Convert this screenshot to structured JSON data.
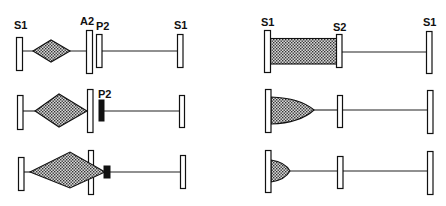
{
  "diagram": {
    "left_panel": {
      "rows": [
        {
          "labels": {
            "left": "S1",
            "middle_a": "A2",
            "middle_b": "P2",
            "right": "S1"
          },
          "state": "small diamond between S1 and A2; open P2 bar"
        },
        {
          "labels": {
            "middle_b": "P2"
          },
          "state": "larger diamond touching A2; P2 shown as filled block"
        },
        {
          "labels": {},
          "state": "large diamond passing through A2; small filled block at tip"
        }
      ]
    },
    "right_panel": {
      "rows": [
        {
          "labels": {
            "left": "S1",
            "middle": "S2",
            "right": "S1"
          },
          "state": "shaded rectangle filling S1 to S2"
        },
        {
          "labels": {},
          "state": "medium bullet-shaped shaded region from S1"
        },
        {
          "labels": {},
          "state": "small bullet-shaped shaded region from S1"
        }
      ]
    }
  }
}
